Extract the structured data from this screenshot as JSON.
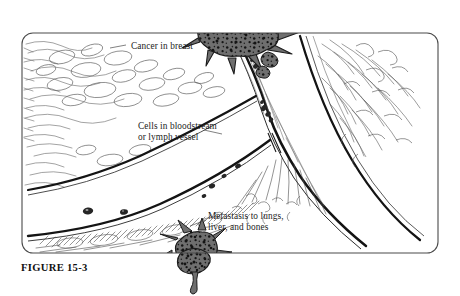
{
  "figure": {
    "caption": "FIGURE 15-3",
    "domain": "medical-illustration",
    "frame": {
      "x": 22,
      "y": 33,
      "width": 416,
      "height": 220,
      "corner_radius": 11,
      "border_color": "#4a4a4a",
      "background_color": "#ffffff"
    },
    "annotations": [
      {
        "id": "label-cancer",
        "name": "cancer-in-breast-label",
        "text": "Cancer in breast",
        "lines": [
          "Cancer in breast"
        ],
        "x": 131,
        "y": 41,
        "points_to": "primary-tumor-mass"
      },
      {
        "id": "label-cells",
        "name": "cells-in-bloodstream-label",
        "text": "Cells in bloodstream\nor lymph vessel",
        "lines": [
          "Cells in bloodstream",
          "or lymph vessel"
        ],
        "x": 138,
        "y": 121,
        "points_to": "circulating-tumor-cells"
      },
      {
        "id": "label-meta",
        "name": "metastasis-label",
        "text": "Metastasis to lungs,\nliver, and bones",
        "lines": [
          "Metastasis to lungs,",
          "liver, and bones"
        ],
        "x": 208,
        "y": 211,
        "points_to": "metastatic-tumor-mass"
      }
    ],
    "colors": {
      "tumor_fill": "#6f6f6f",
      "tumor_speckle": "#141414",
      "tumor_outline": "#1c1c1c",
      "vessel_wall": "#161616",
      "tissue_stroke": "#5d5d5d",
      "hatching_stroke": "#3f3f3f",
      "cell_fill": "#2b2b2b",
      "text": "#1b1b1b",
      "frame_border": "#4a4a4a",
      "page_background": "#ffffff"
    },
    "elements": {
      "primary_tumor": {
        "name": "primary-tumor-mass",
        "label": "Cancer in breast",
        "center_x": 228,
        "center_y": 27,
        "speckle_count": 46,
        "description": "Irregular spiculated dark mass at top, breaching the vessel wall"
      },
      "metastatic_tumor": {
        "name": "metastatic-tumor-mass",
        "label": "Metastasis to lungs, liver, and bones",
        "center_x": 193,
        "center_y": 257,
        "speckle_count": 26,
        "description": "Smaller spiculated dark mass at bottom, crossing the frame edge"
      },
      "circulating_cells": {
        "name": "circulating-tumor-cells",
        "label": "Cells in bloodstream or lymph vessel",
        "count": 14,
        "description": "Small dark cell clusters drifting along the vessel lumen"
      },
      "vessel": {
        "name": "blood-vessel",
        "description": "Large curved vessel sweeping from top-left down to bottom-right with a V-shaped bifurcation"
      },
      "tissue": {
        "name": "breast-tissue",
        "description": "Wispy loose line-art strokes filling the upper-left and lower regions"
      }
    }
  }
}
